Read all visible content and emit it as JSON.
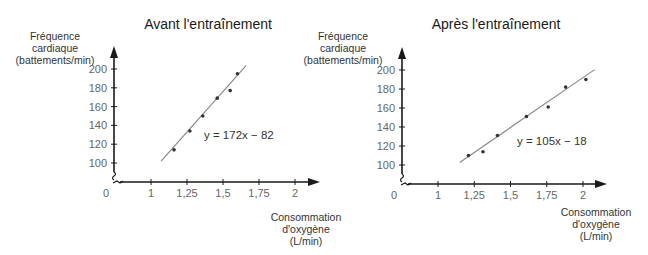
{
  "chart_data": [
    {
      "type": "scatter",
      "title": "Avant l'entraînement",
      "ylabel": [
        "Fréquence",
        "cardiaque",
        "(battements/min)"
      ],
      "xlabel": [
        "Consommation",
        "d'oxygène",
        "(L/min)"
      ],
      "x_ticks": [
        "0",
        "1",
        "1,25",
        "1,5",
        "1,75",
        "2"
      ],
      "y_ticks": [
        "100",
        "120",
        "140",
        "160",
        "180",
        "200"
      ],
      "xlim": [
        1,
        2
      ],
      "ylim": [
        100,
        200
      ],
      "axis_break": true,
      "grid": false,
      "points": [
        {
          "x": 1.16,
          "y": 114
        },
        {
          "x": 1.27,
          "y": 134
        },
        {
          "x": 1.36,
          "y": 150
        },
        {
          "x": 1.46,
          "y": 169
        },
        {
          "x": 1.55,
          "y": 177
        },
        {
          "x": 1.6,
          "y": 195
        }
      ],
      "fit_line": {
        "slope": 172,
        "intercept": -82,
        "x_range": [
          1.07,
          1.66
        ]
      },
      "equation_label": "y = 172x − 82"
    },
    {
      "type": "scatter",
      "title": "Après l'entraînement",
      "ylabel": [
        "Fréquence",
        "cardiaque",
        "(battements/min)"
      ],
      "xlabel": [
        "Consommation",
        "d'oxygène",
        "(L/min)"
      ],
      "x_ticks": [
        "0",
        "1",
        "1,25",
        "1,5",
        "1,75",
        "2"
      ],
      "y_ticks": [
        "100",
        "120",
        "140",
        "160",
        "180",
        "200"
      ],
      "xlim": [
        1,
        2
      ],
      "ylim": [
        100,
        200
      ],
      "axis_break": true,
      "grid": false,
      "points": [
        {
          "x": 1.21,
          "y": 110
        },
        {
          "x": 1.31,
          "y": 114
        },
        {
          "x": 1.41,
          "y": 131
        },
        {
          "x": 1.61,
          "y": 151
        },
        {
          "x": 1.76,
          "y": 161
        },
        {
          "x": 1.88,
          "y": 182
        },
        {
          "x": 2.02,
          "y": 190
        }
      ],
      "fit_line": {
        "slope": 105,
        "intercept": -18,
        "x_range": [
          1.15,
          2.08
        ]
      },
      "equation_label": "y = 105x − 18"
    }
  ],
  "colors": {
    "axis": "#1a1a1a",
    "fit_line": "#8a8a8a",
    "point": "#333333",
    "tick_label": "#666666"
  }
}
